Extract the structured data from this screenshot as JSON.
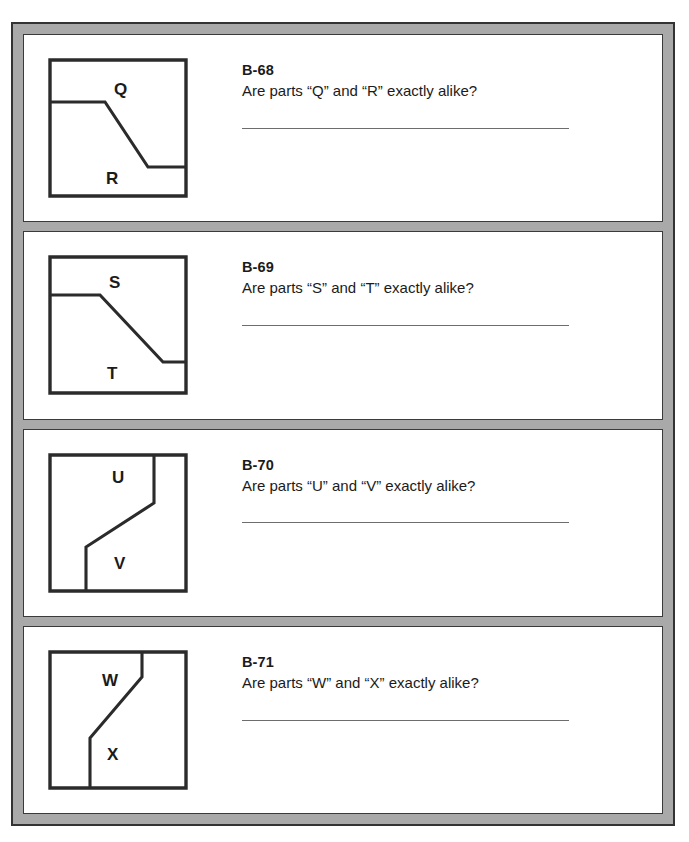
{
  "page": {
    "frame_color": "#a9a9a9",
    "frame_border_color": "#333333",
    "panel_bg": "#ffffff",
    "line_color": "#2b2b2b",
    "text_color": "#1b1b1b",
    "answer_rule_color": "#6d6d6d"
  },
  "exercises": [
    {
      "number": "B-68",
      "question": "Are parts “Q” and “R” exactly alike?",
      "answer_value": "",
      "part_top": "Q",
      "part_bottom": "R",
      "figure": {
        "kind": "step-down-horizontal",
        "outline": "M 6 6 L 142 6 L 142 142 L 6 142 Z",
        "cut": "M 6 48 L 61 48 L 104 113 L 142 113",
        "label_top": {
          "text": "Q",
          "x": 70,
          "y": 41
        },
        "label_bottom": {
          "text": "R",
          "x": 62,
          "y": 130
        }
      }
    },
    {
      "number": "B-69",
      "question": "Are parts “S” and “T” exactly alike?",
      "answer_value": "",
      "part_top": "S",
      "part_bottom": "T",
      "figure": {
        "kind": "step-down-horizontal",
        "outline": "M 6 6 L 142 6 L 142 142 L 6 142 Z",
        "cut": "M 6 44 L 56 44 L 119 111 L 142 111",
        "label_top": {
          "text": "S",
          "x": 65,
          "y": 37
        },
        "label_bottom": {
          "text": "T",
          "x": 63,
          "y": 128
        }
      }
    },
    {
      "number": "B-70",
      "question": "Are parts “U” and “V” exactly alike?",
      "answer_value": "",
      "part_top": "U",
      "part_bottom": "V",
      "figure": {
        "kind": "step-down-vertical",
        "outline": "M 6 6 L 142 6 L 142 142 L 6 142 Z",
        "cut": "M 110 6 L 110 54 L 42 98 L 42 142",
        "label_top": {
          "text": "U",
          "x": 68,
          "y": 34
        },
        "label_bottom": {
          "text": "V",
          "x": 70,
          "y": 120
        }
      }
    },
    {
      "number": "B-71",
      "question": "Are parts “W” and “X” exactly alike?",
      "answer_value": "",
      "part_top": "W",
      "part_bottom": "X",
      "figure": {
        "kind": "step-down-vertical",
        "outline": "M 6 6 L 142 6 L 142 142 L 6 142 Z",
        "cut": "M 98 6 L 98 31 L 46 92 L 46 142",
        "label_top": {
          "text": "W",
          "x": 58,
          "y": 40
        },
        "label_bottom": {
          "text": "X",
          "x": 63,
          "y": 114
        }
      }
    }
  ]
}
